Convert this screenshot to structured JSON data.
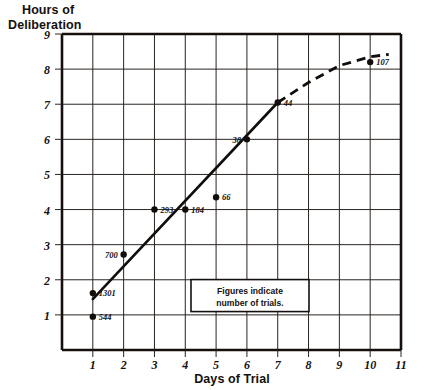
{
  "chart_data": {
    "type": "scatter",
    "title": "Hours of Deliberation",
    "xlabel": "Days of Trial",
    "ylabel": "Hours of Deliberation",
    "ylabel_line1": "Hours of",
    "ylabel_line2": "Deliberation",
    "xlim": [
      0,
      11
    ],
    "ylim": [
      0,
      9
    ],
    "grid": true,
    "xticks": [
      "1",
      "2",
      "3",
      "4",
      "5",
      "6",
      "7",
      "8",
      "9",
      "10",
      "11"
    ],
    "xtick_values": [
      1,
      2,
      3,
      4,
      5,
      6,
      7,
      8,
      9,
      10,
      11
    ],
    "yticks": [
      "1",
      "2",
      "3",
      "4",
      "5",
      "6",
      "7",
      "8",
      "9"
    ],
    "ytick_values": [
      1,
      2,
      3,
      4,
      5,
      6,
      7,
      8,
      9
    ],
    "points": [
      {
        "x": 1,
        "y": 0.95,
        "label": "544",
        "label_pos": "right"
      },
      {
        "x": 1,
        "y": 1.62,
        "label": "1301",
        "label_pos": "right"
      },
      {
        "x": 2,
        "y": 2.72,
        "label": "700",
        "label_pos": "left"
      },
      {
        "x": 3,
        "y": 4.0,
        "label": "293",
        "label_pos": "right"
      },
      {
        "x": 4,
        "y": 4.0,
        "label": "184",
        "label_pos": "right"
      },
      {
        "x": 5,
        "y": 4.35,
        "label": "66",
        "label_pos": "right"
      },
      {
        "x": 6,
        "y": 6.0,
        "label": "38",
        "label_pos": "left"
      },
      {
        "x": 7,
        "y": 7.05,
        "label": "44",
        "label_pos": "right"
      },
      {
        "x": 10,
        "y": 8.2,
        "label": "107",
        "label_pos": "right"
      }
    ],
    "trend_solid": [
      {
        "x": 1,
        "y": 1.45
      },
      {
        "x": 7,
        "y": 7.05
      }
    ],
    "trend_dashed": [
      {
        "x": 7,
        "y": 7.05
      },
      {
        "x": 8,
        "y": 7.62
      },
      {
        "x": 9,
        "y": 8.1
      },
      {
        "x": 10,
        "y": 8.35
      },
      {
        "x": 10.6,
        "y": 8.42
      }
    ],
    "annotation": {
      "line1": "Figures indicate",
      "line2": "number of trials.",
      "x": 6.1,
      "y": 1.55
    },
    "colors": {
      "ink": "#15100e",
      "grid": "#2a2421",
      "background": "#ffffff"
    }
  }
}
